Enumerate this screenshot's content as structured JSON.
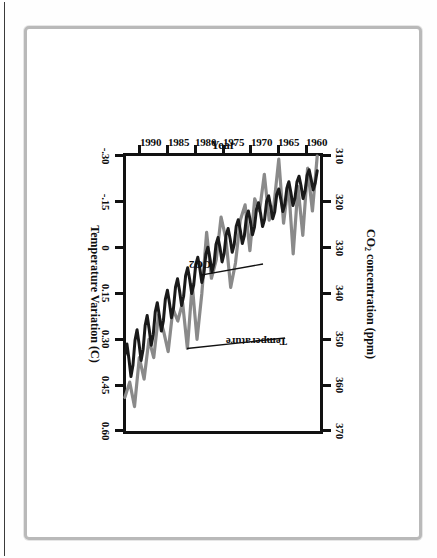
{
  "figure": {
    "orientation": "rotated-90-clockwise",
    "background": "#ffffff",
    "frame_color": "#b9b9b9"
  },
  "chart_data": {
    "type": "line",
    "title": "",
    "xlabel": "Year",
    "ylabel_left": "CO2 concentration (ppm)",
    "ylabel_right": "Temperature Variation (C)",
    "grid": false,
    "legend": "inline-annotations",
    "x": [
      1958,
      1960,
      1962,
      1964,
      1966,
      1968,
      1970,
      1972,
      1974,
      1976,
      1978,
      1980,
      1982,
      1984,
      1986,
      1988,
      1990,
      1992
    ],
    "xlim": [
      1957.5,
      1992.5
    ],
    "xticks": [
      1960,
      1965,
      1970,
      1975,
      1980,
      1985,
      1990
    ],
    "xticklabels": [
      "1960",
      "1965",
      "1970",
      "1975",
      "1980",
      "1985",
      "1990"
    ],
    "co2_axis": {
      "label": "CO2 concentration (ppm)",
      "unit": "ppm",
      "lim": [
        310,
        370
      ],
      "ticks": [
        310,
        320,
        330,
        340,
        350,
        360,
        370
      ],
      "ticklabels": [
        "310",
        "320",
        "330",
        "340",
        "350",
        "360",
        "370"
      ],
      "color": "#1a1a1a"
    },
    "temperature_axis": {
      "label": "Temperature Variation (C)",
      "unit": "C",
      "lim": [
        -0.3,
        0.6
      ],
      "ticks": [
        0.6,
        0.45,
        0.3,
        0.15,
        0,
        -0.15,
        -0.3
      ],
      "ticklabels": [
        "0.60",
        "0.45",
        "0.30",
        "0.15",
        "0",
        "-.15",
        "-.30"
      ],
      "color": "#8a8a8a"
    },
    "series": [
      {
        "name": "CO2",
        "annotation": "CO2",
        "axis": "co2",
        "color": "#1a1a1a",
        "style": "sawtooth-seasonal",
        "description": "Mauna Loa monthly CO2 with strong seasonal cycle rising from ~315 ppm (1958) to ~357 ppm (1992)",
        "annual_mean": [
          315.0,
          316.7,
          318.3,
          319.3,
          320.9,
          322.9,
          325.5,
          327.3,
          330.1,
          332.0,
          335.3,
          338.5,
          341.0,
          344.3,
          347.1,
          351.4,
          354.1,
          356.3
        ],
        "seasonal_amplitude_ppm": 6.0
      },
      {
        "name": "Temperature",
        "annotation": "Temperature",
        "axis": "temperature",
        "color": "#8a8a8a",
        "style": "annual-anomaly",
        "description": "Global annual surface temperature variation anomaly in degrees C",
        "values": [
          -0.26,
          -0.04,
          0.02,
          -0.21,
          -0.09,
          -0.12,
          0.01,
          -0.09,
          0.13,
          -0.1,
          0.1,
          0.15,
          0.33,
          0.2,
          0.27,
          0.36,
          0.43,
          0.49
        ]
      }
    ],
    "monthly_co2": [
      313.2,
      315.9,
      317.4,
      315.1,
      313.0,
      314.2,
      317.6,
      319.3,
      316.5,
      314.4,
      315.6,
      319.2,
      320.8,
      318.0,
      315.6,
      317.0,
      320.6,
      322.1,
      319.4,
      317.2,
      318.4,
      322.2,
      323.7,
      321.0,
      318.7,
      319.9,
      323.8,
      325.4,
      322.5,
      320.2,
      321.6,
      325.5,
      327.2,
      324.3,
      322.0,
      323.4,
      327.4,
      329.1,
      326.2,
      323.9,
      325.3,
      329.3,
      331.0,
      328.1,
      325.8,
      327.2,
      331.3,
      333.1,
      330.1,
      327.8,
      329.3,
      333.5,
      335.3,
      332.3,
      329.9,
      331.4,
      335.7,
      337.6,
      334.5,
      332.1,
      333.7,
      338.1,
      340.0,
      336.9,
      334.4,
      336.1,
      340.6,
      342.6,
      339.4,
      336.8,
      338.6,
      343.2,
      345.3,
      342.0,
      339.3,
      341.2,
      346.0,
      348.2,
      344.8,
      342.0,
      344.0,
      349.0,
      351.3,
      347.8,
      344.8,
      347.0,
      352.2,
      354.6,
      351.0,
      347.9,
      350.2,
      355.6,
      358.1,
      354.3,
      351.0,
      353.4
    ],
    "monthly_temperature": [
      -0.3,
      -0.12,
      -0.26,
      -0.04,
      -0.2,
      0.02,
      -0.21,
      -0.08,
      -0.29,
      -0.14,
      -0.09,
      -0.24,
      -0.12,
      -0.16,
      0.01,
      -0.14,
      -0.09,
      0.05,
      0.13,
      -0.03,
      -0.1,
      0.04,
      0.1,
      -0.05,
      0.15,
      0.3,
      0.12,
      0.33,
      0.18,
      0.24,
      0.2,
      0.34,
      0.27,
      0.22,
      0.36,
      0.3,
      0.43,
      0.36,
      0.52,
      0.44,
      0.49
    ]
  },
  "annotations": {
    "temperature_label": "Temperature",
    "co2_label": "CO2"
  },
  "axis_titles": {
    "co2_prefix": "CO",
    "co2_subscript": "2",
    "co2_suffix": " concentration (ppm)",
    "temperature": "Temperature Variation (C)",
    "year": "Year"
  }
}
